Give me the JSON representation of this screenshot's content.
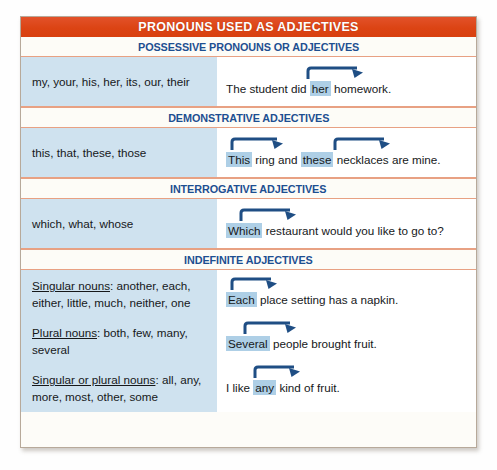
{
  "colors": {
    "title_band": "#dc4414",
    "section_header_text": "#1d4f91",
    "left_column_bg": "#cfe2ef",
    "highlight": "#aecfe6",
    "arrow": "#1f4e84",
    "rule": "#e8a183",
    "card_border": "#b7a99a"
  },
  "title": "PRONOUNS USED AS ADJECTIVES",
  "sections": [
    {
      "header": "POSSESSIVE PRONOUNS OR ADJECTIVES",
      "left": "my, your, his, her, its, our, their",
      "sentence": {
        "before": "The student did ",
        "highlight": "her",
        "after": " homework."
      }
    },
    {
      "header": "DEMONSTRATIVE ADJECTIVES",
      "left": "this, that, these, those",
      "sentence": {
        "before": "",
        "highlight": "This",
        "mid": " ring and ",
        "highlight2": "these",
        "after": " necklaces are mine."
      }
    },
    {
      "header": "INTERROGATIVE ADJECTIVES",
      "left": "which, what, whose",
      "sentence": {
        "before": "",
        "highlight": "Which",
        "after": " restaurant would you like to go to?"
      }
    },
    {
      "header": "INDEFINITE ADJECTIVES",
      "groups": [
        {
          "label": "Singular nouns",
          "colon": ": ",
          "words": "another, each, either, little, much, neither, one",
          "sentence": {
            "before": "",
            "highlight": "Each",
            "after": " place setting has a napkin."
          }
        },
        {
          "label": "Plural nouns",
          "colon": ": ",
          "words": "both, few, many, several",
          "sentence": {
            "before": "",
            "highlight": "Several",
            "after": " people brought fruit."
          }
        },
        {
          "label": "Singular or plural nouns",
          "colon": ": ",
          "words": "all, any, more, most, other, some",
          "sentence": {
            "before": "I like ",
            "highlight": "any",
            "after": " kind of fruit."
          }
        }
      ]
    }
  ]
}
